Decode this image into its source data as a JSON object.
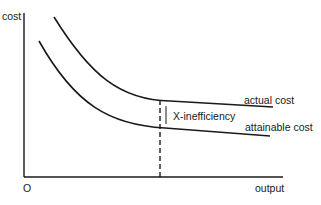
{
  "diagram": {
    "y_axis_label": "cost",
    "x_axis_label": "output",
    "origin_label": "O",
    "curves": [
      {
        "name": "actual cost",
        "label": "actual cost"
      },
      {
        "name": "attainable cost",
        "label": "attainable cost"
      }
    ],
    "gap_label": "X-inefficiency"
  }
}
